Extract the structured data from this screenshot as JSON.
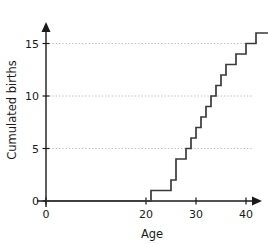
{
  "chart_data": {
    "type": "line",
    "subtype": "step",
    "title": "",
    "xlabel": "Age",
    "ylabel": "Cumulated births",
    "xlim": [
      0,
      49
    ],
    "ylim": [
      0,
      17
    ],
    "xticks": [
      0,
      20,
      30,
      40
    ],
    "xtick_labels": [
      "0",
      "20",
      "30",
      "40"
    ],
    "yticks": [
      0,
      5,
      10,
      15
    ],
    "ytick_labels": [
      "0",
      "5",
      "10",
      "15"
    ],
    "grid": "horizontal-dotted-at-y-5-10-15",
    "legend": "none",
    "step_direction": "post",
    "x": [
      21,
      25,
      26,
      28,
      29,
      30,
      31,
      32,
      33,
      34,
      35,
      36,
      38,
      40,
      42
    ],
    "y": [
      1,
      2,
      4,
      5,
      6,
      7,
      8,
      9,
      10,
      11,
      12,
      13,
      14,
      15,
      16
    ],
    "baseline_y": 0,
    "baseline_x_start": 0,
    "final_plateau_y": 16,
    "final_plateau_x_end": 49,
    "series_color": "#3a3a3a",
    "grid_color": "#b9b9b9",
    "axis_color": "#1a1a1a",
    "background_color": "#ffffff"
  },
  "axes": {
    "x_axis_name": "Age",
    "y_axis_name": "Cumulated births"
  }
}
